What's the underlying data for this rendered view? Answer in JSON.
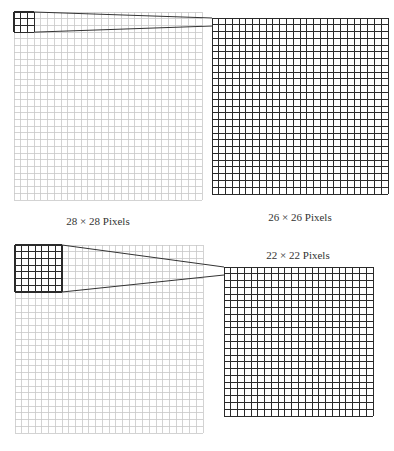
{
  "diagram": {
    "colors": {
      "light_grid": "#c8c8c8",
      "dark_grid": "#2a2a2a",
      "connector": "#333333",
      "label": "#333333"
    },
    "panels": [
      {
        "id": "top",
        "input": {
          "x": 14,
          "y": 12,
          "cells": 28,
          "size": 188,
          "label": "28 × 28 Pixels",
          "label_x": 98,
          "label_y": 215
        },
        "kernel": {
          "cells": 3
        },
        "output": {
          "x": 212,
          "y": 18,
          "cells": 26,
          "size": 176,
          "label": "26 × 26 Pixels",
          "label_x": 300,
          "label_y": 211
        },
        "connector_end_y": [
          18,
          26
        ]
      },
      {
        "id": "bottom",
        "input": {
          "x": 15,
          "y": 245,
          "cells": 28,
          "size": 188,
          "label": "",
          "label_x": 0,
          "label_y": 0
        },
        "kernel": {
          "cells": 7
        },
        "output": {
          "x": 224,
          "y": 267,
          "cells": 22,
          "size": 149,
          "label": "22 × 22 Pixels",
          "label_x": 298,
          "label_y": 249
        },
        "connector_end_y": [
          267,
          275
        ]
      }
    ]
  }
}
